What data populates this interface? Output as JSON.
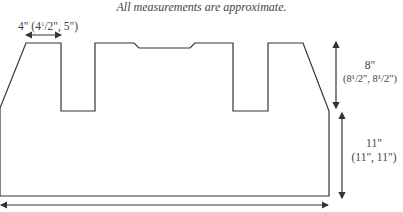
{
  "title": "All measurements are approximate.",
  "labels": {
    "width_top": {
      "main": "4\"",
      "sizes_prefix": "(4",
      "sizes_frac": "1",
      "sizes_suffix": "/2\", 5\")"
    },
    "height_upper": {
      "main": "8\"",
      "sizes": "(8¹/2\", 8¹/2\")"
    },
    "height_lower": {
      "main": "11\"",
      "sizes": "(11\", 11\")"
    }
  },
  "colors": {
    "line": "#333333",
    "text": "#444444",
    "background": "#ffffff"
  },
  "shape": {
    "outline_points": "0,108 26,43 61,43 61,111 95,111 95,43 134,43 139,48 190,48 195,43 233,43 233,111 268,111 268,43 303,43 329,111 329,196 0,196"
  },
  "arrows": [
    {
      "name": "top-width-arrow",
      "x1": 26,
      "y1": 35,
      "x2": 61,
      "y2": 35
    },
    {
      "name": "bottom-width-arrow",
      "x1": 1,
      "y1": 205,
      "x2": 328,
      "y2": 205
    },
    {
      "name": "upper-height-arrow",
      "x1": 336,
      "y1": 42,
      "x2": 336,
      "y2": 108
    },
    {
      "name": "lower-height-arrow",
      "x1": 342,
      "y1": 113,
      "x2": 342,
      "y2": 198
    }
  ]
}
